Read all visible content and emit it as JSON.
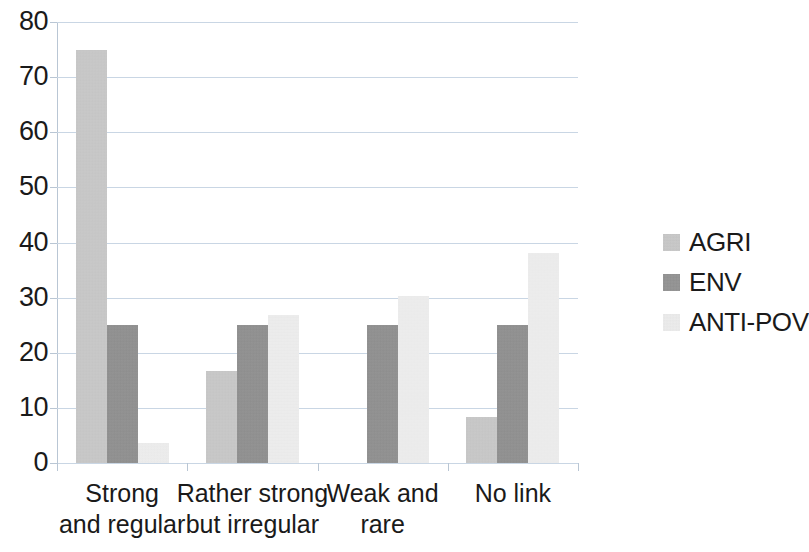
{
  "chart_data": {
    "type": "bar",
    "title": "",
    "subtitle": "",
    "xlabel": "",
    "ylabel": "",
    "ylim": [
      0,
      80
    ],
    "yticks": [
      0,
      10,
      20,
      30,
      40,
      50,
      60,
      70,
      80
    ],
    "ytick_labels": [
      "0",
      "10",
      "20",
      "30",
      "40",
      "50",
      "60",
      "70",
      "80"
    ],
    "grid": true,
    "grid_axis": "y",
    "legend_position": "right",
    "categories": [
      "Strong and regular",
      "Rather strong but irregular",
      "Weak and rare",
      "No link"
    ],
    "category_lines": [
      [
        "Strong",
        "and regular"
      ],
      [
        "Rather strong",
        "but irregular"
      ],
      [
        "Weak and",
        "rare"
      ],
      [
        "No link",
        ""
      ]
    ],
    "series": [
      {
        "name": "AGRI",
        "color": "#c6c6c6",
        "values": [
          75,
          16.7,
          0,
          8.3
        ]
      },
      {
        "name": "ENV",
        "color": "#8d8d8d",
        "values": [
          25,
          25,
          25,
          25
        ]
      },
      {
        "name": "ANTI-POV",
        "color": "#eaeaea",
        "values": [
          3.6,
          26.9,
          30.3,
          38.1
        ]
      }
    ]
  },
  "legend": {
    "items": [
      {
        "label": "AGRI",
        "swatch": "agri"
      },
      {
        "label": "ENV",
        "swatch": "env"
      },
      {
        "label": "ANTI-POV",
        "swatch": "antipov"
      }
    ]
  }
}
